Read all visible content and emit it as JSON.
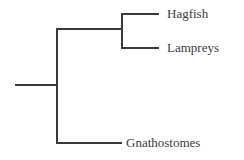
{
  "diagram": {
    "type": "cladogram",
    "line_color": "#3a3a3a",
    "background_color": "#ffffff",
    "line_width": 2,
    "taxa": [
      {
        "id": "hagfish",
        "label": "Hagfish"
      },
      {
        "id": "lampreys",
        "label": "Lampreys"
      },
      {
        "id": "gnathostomes",
        "label": "Gnathostomes"
      }
    ],
    "nodes": {
      "root_stem": {
        "x1": 15,
        "y1": 85,
        "x2": 57,
        "y2": 85
      },
      "basal_vertical": {
        "x": 57,
        "y1": 29,
        "y2": 143
      },
      "upper_connector": {
        "x1": 57,
        "y1": 29,
        "x2": 122,
        "y2": 29
      },
      "clade_vertical": {
        "x": 122,
        "y1": 14,
        "y2": 48
      },
      "hagfish_branch": {
        "x1": 122,
        "y1": 14,
        "x2": 159,
        "y2": 14
      },
      "lampreys_branch": {
        "x1": 122,
        "y1": 48,
        "x2": 159,
        "y2": 48
      },
      "gnathostomes_branch": {
        "x1": 57,
        "y1": 143,
        "x2": 122,
        "y2": 143
      }
    }
  }
}
